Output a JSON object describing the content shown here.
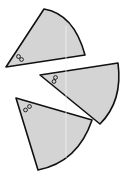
{
  "diagram": {
    "colors": {
      "fill": "#d4d4d4",
      "stroke": "#111111",
      "background": "#ffffff"
    },
    "sectors": [
      {
        "id": "sector-top",
        "vertex": [
          6,
          67
        ],
        "radius_end_a": [
          44,
          9
        ],
        "radius_end_b": [
          85,
          55
        ],
        "marker": [
          18,
          58
        ]
      },
      {
        "id": "sector-middle",
        "vertex": [
          40,
          75
        ],
        "radius_end_a": [
          118,
          63
        ],
        "radius_end_b": [
          100,
          124
        ],
        "marker": [
          55,
          79
        ]
      },
      {
        "id": "sector-bottom",
        "vertex": [
          16,
          98
        ],
        "radius_end_a": [
          92,
          120
        ],
        "radius_end_b": [
          38,
          170
        ],
        "marker": [
          27,
          108
        ]
      }
    ]
  }
}
